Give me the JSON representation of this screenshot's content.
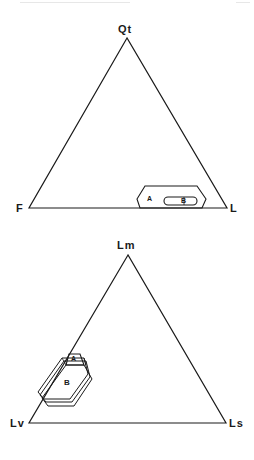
{
  "diagrams": [
    {
      "name": "QtFL-ternary",
      "apices": {
        "top": "Qt",
        "left": "F",
        "right": "L"
      },
      "fields": [
        {
          "label": "A"
        },
        {
          "label": "B"
        }
      ]
    },
    {
      "name": "LmLvLs-ternary",
      "apices": {
        "top": "Lm",
        "left": "Lv",
        "right": "Ls"
      },
      "fields": [
        {
          "label": "A"
        },
        {
          "label": "B"
        }
      ]
    }
  ],
  "colors": {
    "line": "#1a1a1a",
    "background": "#ffffff"
  }
}
